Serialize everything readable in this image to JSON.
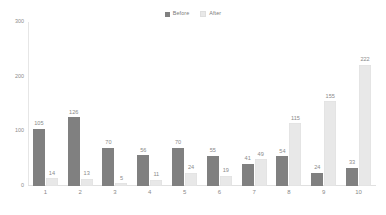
{
  "chart_data": {
    "type": "bar",
    "title": "",
    "xlabel": "",
    "ylabel": "",
    "categories": [
      "1",
      "2",
      "3",
      "4",
      "5",
      "6",
      "7",
      "8",
      "9",
      "10"
    ],
    "series": [
      {
        "name": "Before",
        "color": "#808080",
        "values": [
          105,
          126,
          70,
          56,
          70,
          55,
          41,
          54,
          24,
          33
        ]
      },
      {
        "name": "After",
        "color": "#e8e8e8",
        "values": [
          14,
          13,
          5,
          11,
          24,
          19,
          49,
          115,
          155,
          222
        ]
      }
    ],
    "ylim": [
      0,
      300
    ],
    "yticks": [
      0,
      100,
      200,
      300
    ],
    "ytick_labels": [
      "0",
      "100",
      "200",
      "300"
    ],
    "grid": false,
    "legend_position": "top-center",
    "data_labels": true
  },
  "legend": {
    "items": [
      {
        "label": "Before",
        "swatch": "legend-swatch-before"
      },
      {
        "label": "After",
        "swatch": "legend-swatch-after"
      }
    ]
  },
  "colors": {
    "before": "#808080",
    "after": "#e8e8e8",
    "axis": "#e6e6e6",
    "text": "#8a8a8a",
    "background": "#ffffff"
  }
}
